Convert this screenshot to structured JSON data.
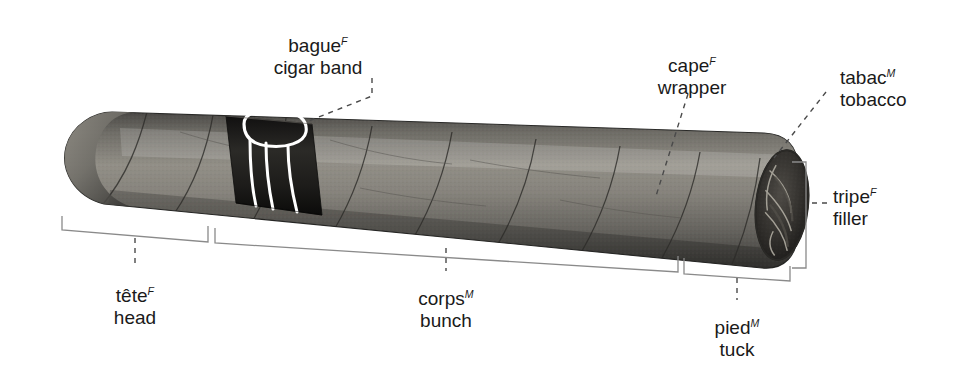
{
  "figure": {
    "subject": "cigar",
    "background_color": "#ffffff",
    "ink_color": "#1a1a1a",
    "body_color": "#7c7a73",
    "band_color": "#201f1d",
    "band_stripe_color": "#ffffff"
  },
  "labels": [
    {
      "id": "bague",
      "term": "bague",
      "gender": "F",
      "english": "cigar band",
      "x": 318,
      "y": 30,
      "align": "center"
    },
    {
      "id": "cape",
      "term": "cape",
      "gender": "F",
      "english": "wrapper",
      "x": 652,
      "y": 50,
      "align": "center"
    },
    {
      "id": "tabac",
      "term": "tabac",
      "gender": "M",
      "english": "tobacco",
      "x": 840,
      "y": 62,
      "align": "left"
    },
    {
      "id": "tripe",
      "term": "tripe",
      "gender": "F",
      "english": "filler",
      "x": 833,
      "y": 181,
      "align": "left"
    },
    {
      "id": "tete",
      "term": "tête",
      "gender": "F",
      "english": "head",
      "x": 135,
      "y": 280,
      "align": "center"
    },
    {
      "id": "corps",
      "term": "corps",
      "gender": "M",
      "english": "bunch",
      "x": 446,
      "y": 283,
      "align": "center"
    },
    {
      "id": "pied",
      "term": "pied",
      "gender": "M",
      "english": "tuck",
      "x": 737,
      "y": 312,
      "align": "center"
    }
  ],
  "brackets": [
    {
      "id": "tete-bracket",
      "orientation": "horizontal",
      "x1": 62,
      "x2": 208,
      "y": 230,
      "tick": 14
    },
    {
      "id": "corps-bracket",
      "orientation": "horizontal",
      "x1": 215,
      "x2": 678,
      "y": 236,
      "tick": 14
    },
    {
      "id": "pied-bracket",
      "orientation": "horizontal",
      "x1": 684,
      "x2": 790,
      "y": 272,
      "tick": 14
    },
    {
      "id": "tripe-bracket",
      "orientation": "vertical",
      "y1": 162,
      "y2": 268,
      "x": 806,
      "tick": 14
    }
  ],
  "leaders": [
    {
      "id": "bague-leader",
      "style": "dashed"
    },
    {
      "id": "cape-leader",
      "style": "dashed"
    },
    {
      "id": "tabac-leader",
      "style": "dashed"
    },
    {
      "id": "tripe-leader",
      "style": "dashed"
    },
    {
      "id": "tete-leader",
      "style": "dashed"
    },
    {
      "id": "corps-leader",
      "style": "dashed"
    },
    {
      "id": "pied-leader",
      "style": "dashed"
    }
  ]
}
